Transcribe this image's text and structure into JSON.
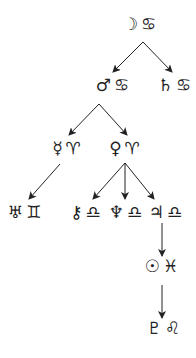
{
  "diagram": {
    "type": "tree",
    "colors": {
      "ink": "#222222",
      "background": "#ffffff"
    },
    "nodes": [
      {
        "id": "moon-cancer",
        "planet": "☽",
        "sign": "♋",
        "planet_name": "Moon",
        "sign_name": "Cancer",
        "x": 140,
        "y": 24
      },
      {
        "id": "mars-cancer",
        "planet": "♂",
        "sign": "♋",
        "planet_name": "Mars",
        "sign_name": "Cancer",
        "x": 113,
        "y": 85
      },
      {
        "id": "saturn-cancer",
        "planet": "♄",
        "sign": "♋",
        "planet_name": "Saturn",
        "sign_name": "Cancer",
        "x": 175,
        "y": 85
      },
      {
        "id": "mercury-aries",
        "planet": "☿",
        "sign": "♈",
        "planet_name": "Mercury",
        "sign_name": "Aries",
        "x": 67,
        "y": 148
      },
      {
        "id": "venus-aries",
        "planet": "♀",
        "sign": "♈",
        "planet_name": "Venus",
        "sign_name": "Aries",
        "x": 125,
        "y": 148
      },
      {
        "id": "uranus-gemini",
        "planet": "♅",
        "sign": "♊",
        "planet_name": "Uranus",
        "sign_name": "Gemini",
        "x": 25,
        "y": 212
      },
      {
        "id": "chiron-libra",
        "planet": "⚷",
        "sign": "♎",
        "planet_name": "Chiron",
        "sign_name": "Libra",
        "x": 86,
        "y": 212
      },
      {
        "id": "neptune-libra",
        "planet": "♆",
        "sign": "♎",
        "planet_name": "Neptune",
        "sign_name": "Libra",
        "x": 126,
        "y": 212
      },
      {
        "id": "jupiter-libra",
        "planet": "♃",
        "sign": "♎",
        "planet_name": "Jupiter",
        "sign_name": "Libra",
        "x": 166,
        "y": 212
      },
      {
        "id": "sun-pisces",
        "planet": "☉",
        "sign": "♓",
        "planet_name": "Sun",
        "sign_name": "Pisces",
        "x": 162,
        "y": 266
      },
      {
        "id": "pluto-leo",
        "planet": "♇",
        "sign": "♌",
        "planet_name": "Pluto",
        "sign_name": "Leo",
        "x": 164,
        "y": 328
      }
    ],
    "edges": [
      {
        "from": "moon-cancer",
        "to": "mars-cancer",
        "x1": 143,
        "y1": 42,
        "x2": 113,
        "y2": 72
      },
      {
        "from": "moon-cancer",
        "to": "saturn-cancer",
        "x1": 143,
        "y1": 42,
        "x2": 172,
        "y2": 72
      },
      {
        "from": "mars-cancer",
        "to": "mercury-aries",
        "x1": 99,
        "y1": 104,
        "x2": 69,
        "y2": 135
      },
      {
        "from": "mars-cancer",
        "to": "venus-aries",
        "x1": 99,
        "y1": 104,
        "x2": 127,
        "y2": 135
      },
      {
        "from": "mercury-aries",
        "to": "uranus-gemini",
        "x1": 60,
        "y1": 164,
        "x2": 29,
        "y2": 199
      },
      {
        "from": "venus-aries",
        "to": "chiron-libra",
        "x1": 125,
        "y1": 163,
        "x2": 93,
        "y2": 199
      },
      {
        "from": "venus-aries",
        "to": "neptune-libra",
        "x1": 125,
        "y1": 163,
        "x2": 125,
        "y2": 199
      },
      {
        "from": "venus-aries",
        "to": "jupiter-libra",
        "x1": 125,
        "y1": 163,
        "x2": 154,
        "y2": 199
      },
      {
        "from": "jupiter-libra",
        "to": "sun-pisces",
        "x1": 162,
        "y1": 223,
        "x2": 162,
        "y2": 256
      },
      {
        "from": "sun-pisces",
        "to": "pluto-leo",
        "x1": 162,
        "y1": 285,
        "x2": 162,
        "y2": 318
      }
    ]
  }
}
